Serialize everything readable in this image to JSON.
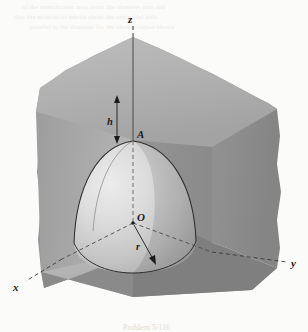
{
  "figure": {
    "caption": "Problem 5/116",
    "background_color": "#fbfbfa"
  },
  "axes": [
    {
      "name": "z-axis",
      "label": "z",
      "style": "dashed",
      "direction": "up",
      "label_x": 131,
      "label_y": 19
    },
    {
      "name": "x-axis",
      "label": "x",
      "style": "dashed",
      "direction": "lower-left",
      "label_x": 17,
      "label_y": 288
    },
    {
      "name": "y-axis",
      "label": "y",
      "style": "dashed",
      "direction": "lower-right",
      "label_x": 294,
      "label_y": 266
    }
  ],
  "points": [
    {
      "name": "point-A",
      "label": "A",
      "description": "apex of spherical cavity on z-axis",
      "label_x": 140,
      "label_y": 136,
      "x": 133,
      "y": 141
    },
    {
      "name": "point-O",
      "label": "O",
      "description": "origin / center of sphere",
      "label_x": 141,
      "label_y": 221,
      "x": 133,
      "y": 223
    }
  ],
  "dimensions": [
    {
      "name": "height-h",
      "label": "h",
      "description": "distance from top face down to apex A",
      "label_x": 113,
      "label_y": 122,
      "arrow_x": 117,
      "arrow_top_y": 97,
      "arrow_bottom_y": 142
    },
    {
      "name": "radius-r",
      "label": "r",
      "description": "radius of spherical cavity from O",
      "label_x": 140,
      "label_y": 247,
      "from_x": 133,
      "from_y": 223,
      "to_x": 155,
      "to_y": 263
    }
  ],
  "solid": {
    "name": "block",
    "description": "rectangular solid with jagged broken-away top and outer edges",
    "faces": [
      {
        "name": "top-face",
        "fill": "#b3b3b3"
      },
      {
        "name": "left-face",
        "fill": "#999999"
      },
      {
        "name": "right-face",
        "fill": "#8e8e8e"
      },
      {
        "name": "outer-left-slab",
        "fill": "#a0a0a0"
      },
      {
        "name": "outer-right-slab",
        "fill": "#9a9a9a"
      }
    ]
  },
  "cavity": {
    "name": "spherical-cavity",
    "description": "quarter-sphere hollow centered at O, apex at A",
    "highlight_fill": "#e2e2e2",
    "shadow_fill": "#bdbdbd",
    "outline_color": "#2e2e2e"
  },
  "ghost_text": {
    "line1": "of the semicircular area about the diameter axis and",
    "line2": "also the moment of inertia about the centroidal axis",
    "line3": "parallel to the diameter for the shaded region shown"
  },
  "colors": {
    "ink": "#1b1b1b",
    "paper": "#fbfbfa",
    "edge_light": "#e8e8e8",
    "edge_dark": "#3a3a3a"
  }
}
